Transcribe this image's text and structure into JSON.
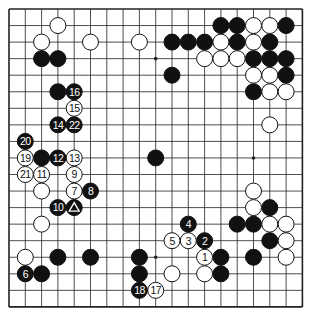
{
  "board": {
    "size": 19,
    "origin_x": 9,
    "origin_y": 9,
    "spacing_x": 16.3,
    "spacing_y": 16.55,
    "stone_radius": 8,
    "colors": {
      "background": "#ffffff",
      "line": "#222222",
      "black": "#111111",
      "white": "#ffffff"
    },
    "star_points": [
      [
        3,
        3
      ],
      [
        9,
        3
      ],
      [
        15,
        3
      ],
      [
        3,
        9
      ],
      [
        9,
        9
      ],
      [
        15,
        9
      ],
      [
        3,
        15
      ],
      [
        9,
        15
      ],
      [
        15,
        15
      ]
    ]
  },
  "stones": {
    "black": [
      [
        13,
        1
      ],
      [
        14,
        1
      ],
      [
        17,
        1
      ],
      [
        10,
        2
      ],
      [
        11,
        2
      ],
      [
        12,
        2
      ],
      [
        14,
        2
      ],
      [
        16,
        2
      ],
      [
        15,
        3
      ],
      [
        16,
        3
      ],
      [
        17,
        3
      ],
      [
        2,
        3
      ],
      [
        3,
        3
      ],
      [
        10,
        4
      ],
      [
        17,
        4
      ],
      [
        15,
        5
      ],
      [
        3,
        5
      ],
      [
        9,
        9
      ],
      [
        2,
        9
      ],
      [
        16,
        12
      ],
      [
        14,
        13
      ],
      [
        15,
        13
      ],
      [
        16,
        14
      ],
      [
        13,
        15
      ],
      [
        15,
        15
      ],
      [
        13,
        16
      ],
      [
        3,
        15
      ],
      [
        5,
        15
      ],
      [
        8,
        15
      ],
      [
        2,
        16
      ],
      [
        8,
        16
      ]
    ],
    "white": [
      [
        15,
        1
      ],
      [
        16,
        1
      ],
      [
        13,
        2
      ],
      [
        15,
        2
      ],
      [
        12,
        3
      ],
      [
        13,
        3
      ],
      [
        14,
        3
      ],
      [
        15,
        4
      ],
      [
        16,
        4
      ],
      [
        16,
        5
      ],
      [
        17,
        5
      ],
      [
        3,
        1
      ],
      [
        2,
        2
      ],
      [
        5,
        2
      ],
      [
        8,
        2
      ],
      [
        16,
        7
      ],
      [
        15,
        11
      ],
      [
        15,
        12
      ],
      [
        16,
        13
      ],
      [
        17,
        13
      ],
      [
        17,
        14
      ],
      [
        17,
        15
      ],
      [
        2,
        11
      ],
      [
        2,
        13
      ],
      [
        1,
        15
      ],
      [
        10,
        16
      ],
      [
        12,
        16
      ]
    ]
  },
  "moves": [
    {
      "n": "1",
      "color": "white",
      "x": 12,
      "y": 15
    },
    {
      "n": "2",
      "color": "black",
      "x": 12,
      "y": 14
    },
    {
      "n": "3",
      "color": "white",
      "x": 11,
      "y": 14
    },
    {
      "n": "4",
      "color": "black",
      "x": 11,
      "y": 13
    },
    {
      "n": "5",
      "color": "white",
      "x": 10,
      "y": 14
    },
    {
      "n": "6",
      "color": "black",
      "x": 1,
      "y": 16
    },
    {
      "n": "7",
      "color": "white",
      "x": 4,
      "y": 11
    },
    {
      "n": "8",
      "color": "black",
      "x": 5,
      "y": 11
    },
    {
      "n": "9",
      "color": "white",
      "x": 4,
      "y": 10
    },
    {
      "n": "10",
      "color": "black",
      "x": 3,
      "y": 12
    },
    {
      "n": "11",
      "color": "white",
      "x": 2,
      "y": 10
    },
    {
      "n": "12",
      "color": "black",
      "x": 3,
      "y": 9
    },
    {
      "n": "13",
      "color": "white",
      "x": 4,
      "y": 9
    },
    {
      "n": "14",
      "color": "black",
      "x": 3,
      "y": 7
    },
    {
      "n": "15",
      "color": "white",
      "x": 4,
      "y": 6
    },
    {
      "n": "16",
      "color": "black",
      "x": 4,
      "y": 5
    },
    {
      "n": "17",
      "color": "white",
      "x": 9,
      "y": 17
    },
    {
      "n": "18",
      "color": "black",
      "x": 8,
      "y": 17
    },
    {
      "n": "19",
      "color": "white",
      "x": 1,
      "y": 9
    },
    {
      "n": "20",
      "color": "black",
      "x": 1,
      "y": 8
    },
    {
      "n": "21",
      "color": "white",
      "x": 1,
      "y": 10
    },
    {
      "n": "22",
      "color": "black",
      "x": 4,
      "y": 7
    }
  ],
  "markers": [
    {
      "type": "triangle",
      "color": "black",
      "x": 4,
      "y": 12
    }
  ]
}
